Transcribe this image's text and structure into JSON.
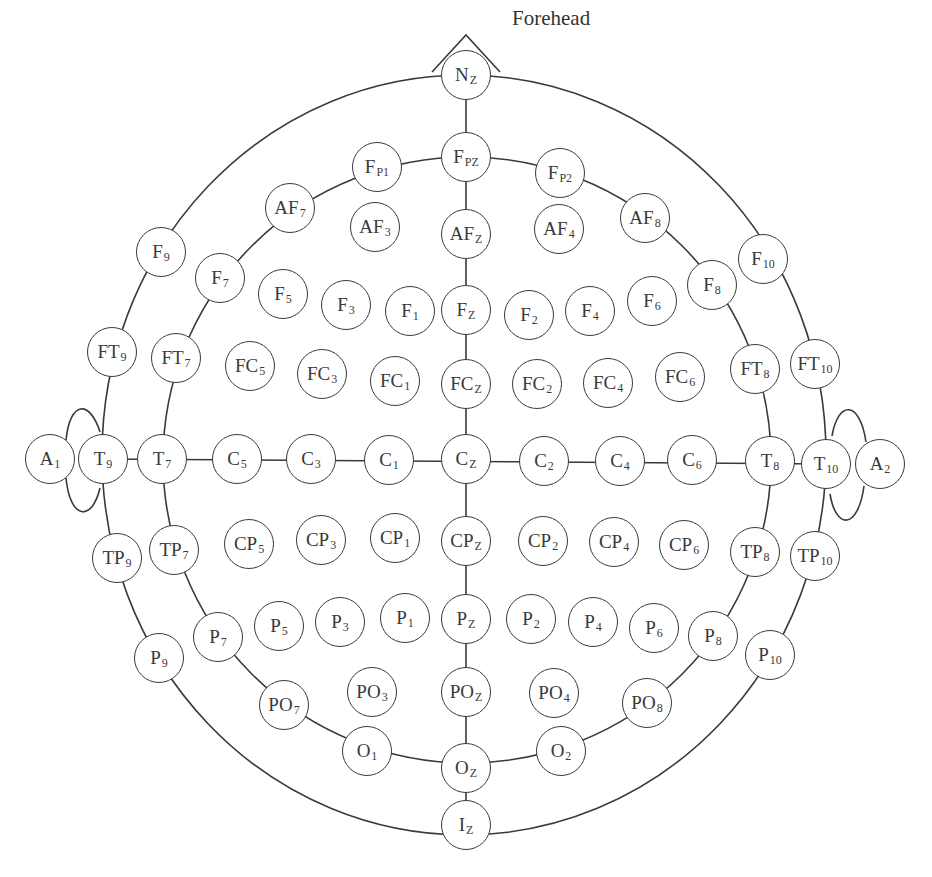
{
  "diagram": {
    "orientation_label": "Forehead",
    "line_color": "#3a3a3a",
    "background": "#ffffff"
  },
  "electrodes": [
    {
      "id": "Nz",
      "base": "N",
      "sub": "Z",
      "x": 466,
      "y": 75
    },
    {
      "id": "Fpz",
      "base": "F",
      "sub": "PZ",
      "x": 466,
      "y": 157
    },
    {
      "id": "Fp1",
      "base": "F",
      "sub": "P1",
      "x": 377,
      "y": 167
    },
    {
      "id": "Fp2",
      "base": "F",
      "sub": "P2",
      "x": 560,
      "y": 173
    },
    {
      "id": "AF7",
      "base": "AF",
      "sub": "7",
      "x": 290,
      "y": 208
    },
    {
      "id": "AF3",
      "base": "AF",
      "sub": "3",
      "x": 375,
      "y": 227
    },
    {
      "id": "AFz",
      "base": "AF",
      "sub": "Z",
      "x": 466,
      "y": 234
    },
    {
      "id": "AF4",
      "base": "AF",
      "sub": "4",
      "x": 559,
      "y": 229
    },
    {
      "id": "AF8",
      "base": "AF",
      "sub": "8",
      "x": 645,
      "y": 218
    },
    {
      "id": "F9",
      "base": "F",
      "sub": "9",
      "x": 161,
      "y": 252
    },
    {
      "id": "F7",
      "base": "F",
      "sub": "7",
      "x": 220,
      "y": 278
    },
    {
      "id": "F5",
      "base": "F",
      "sub": "5",
      "x": 283,
      "y": 294
    },
    {
      "id": "F3",
      "base": "F",
      "sub": "3",
      "x": 346,
      "y": 305
    },
    {
      "id": "F1",
      "base": "F",
      "sub": "1",
      "x": 410,
      "y": 311
    },
    {
      "id": "Fz",
      "base": "F",
      "sub": "Z",
      "x": 466,
      "y": 310
    },
    {
      "id": "F2",
      "base": "F",
      "sub": "2",
      "x": 529,
      "y": 315
    },
    {
      "id": "F4",
      "base": "F",
      "sub": "4",
      "x": 590,
      "y": 311
    },
    {
      "id": "F6",
      "base": "F",
      "sub": "6",
      "x": 652,
      "y": 301
    },
    {
      "id": "F8",
      "base": "F",
      "sub": "8",
      "x": 712,
      "y": 285
    },
    {
      "id": "F10",
      "base": "F",
      "sub": "10",
      "x": 763,
      "y": 259
    },
    {
      "id": "FT9",
      "base": "FT",
      "sub": "9",
      "x": 112,
      "y": 352
    },
    {
      "id": "FT7",
      "base": "FT",
      "sub": "7",
      "x": 176,
      "y": 358
    },
    {
      "id": "FC5",
      "base": "FC",
      "sub": "5",
      "x": 250,
      "y": 366
    },
    {
      "id": "FC3",
      "base": "FC",
      "sub": "3",
      "x": 322,
      "y": 374
    },
    {
      "id": "FC1",
      "base": "FC",
      "sub": "1",
      "x": 395,
      "y": 381
    },
    {
      "id": "FCz",
      "base": "FC",
      "sub": "Z",
      "x": 466,
      "y": 384
    },
    {
      "id": "FC2",
      "base": "FC",
      "sub": "2",
      "x": 537,
      "y": 384
    },
    {
      "id": "FC4",
      "base": "FC",
      "sub": "4",
      "x": 608,
      "y": 383
    },
    {
      "id": "FC6",
      "base": "FC",
      "sub": "6",
      "x": 680,
      "y": 377
    },
    {
      "id": "FT8",
      "base": "FT",
      "sub": "8",
      "x": 755,
      "y": 369
    },
    {
      "id": "FT10",
      "base": "FT",
      "sub": "10",
      "x": 815,
      "y": 364
    },
    {
      "id": "A1",
      "base": "A",
      "sub": "1",
      "x": 50,
      "y": 459
    },
    {
      "id": "T9",
      "base": "T",
      "sub": "9",
      "x": 103,
      "y": 459
    },
    {
      "id": "T7",
      "base": "T",
      "sub": "7",
      "x": 162,
      "y": 459
    },
    {
      "id": "C5",
      "base": "C",
      "sub": "5",
      "x": 237,
      "y": 459
    },
    {
      "id": "C3",
      "base": "C",
      "sub": "3",
      "x": 311,
      "y": 459
    },
    {
      "id": "C1",
      "base": "C",
      "sub": "1",
      "x": 389,
      "y": 460
    },
    {
      "id": "Cz",
      "base": "C",
      "sub": "Z",
      "x": 466,
      "y": 459
    },
    {
      "id": "C2",
      "base": "C",
      "sub": "2",
      "x": 544,
      "y": 461
    },
    {
      "id": "C4",
      "base": "C",
      "sub": "4",
      "x": 620,
      "y": 461
    },
    {
      "id": "C6",
      "base": "C",
      "sub": "6",
      "x": 692,
      "y": 460
    },
    {
      "id": "T8",
      "base": "T",
      "sub": "8",
      "x": 770,
      "y": 461
    },
    {
      "id": "T10",
      "base": "T",
      "sub": "10",
      "x": 826,
      "y": 464
    },
    {
      "id": "A2",
      "base": "A",
      "sub": "2",
      "x": 880,
      "y": 464
    },
    {
      "id": "TP9",
      "base": "TP",
      "sub": "9",
      "x": 117,
      "y": 558
    },
    {
      "id": "TP7",
      "base": "TP",
      "sub": "7",
      "x": 174,
      "y": 550
    },
    {
      "id": "CP5",
      "base": "CP",
      "sub": "5",
      "x": 249,
      "y": 544
    },
    {
      "id": "CP3",
      "base": "CP",
      "sub": "3",
      "x": 321,
      "y": 540
    },
    {
      "id": "CP1",
      "base": "CP",
      "sub": "1",
      "x": 395,
      "y": 538
    },
    {
      "id": "CPz",
      "base": "CP",
      "sub": "Z",
      "x": 466,
      "y": 541
    },
    {
      "id": "CP2",
      "base": "CP",
      "sub": "2",
      "x": 543,
      "y": 541
    },
    {
      "id": "CP4",
      "base": "CP",
      "sub": "4",
      "x": 614,
      "y": 542
    },
    {
      "id": "CP6",
      "base": "CP",
      "sub": "6",
      "x": 684,
      "y": 545
    },
    {
      "id": "TP8",
      "base": "TP",
      "sub": "8",
      "x": 755,
      "y": 552
    },
    {
      "id": "TP10",
      "base": "TP",
      "sub": "10",
      "x": 815,
      "y": 556
    },
    {
      "id": "P9",
      "base": "P",
      "sub": "9",
      "x": 159,
      "y": 658
    },
    {
      "id": "P7",
      "base": "P",
      "sub": "7",
      "x": 218,
      "y": 637
    },
    {
      "id": "P5",
      "base": "P",
      "sub": "5",
      "x": 279,
      "y": 626
    },
    {
      "id": "P3",
      "base": "P",
      "sub": "3",
      "x": 340,
      "y": 622
    },
    {
      "id": "P1",
      "base": "P",
      "sub": "1",
      "x": 405,
      "y": 618
    },
    {
      "id": "Pz",
      "base": "P",
      "sub": "Z",
      "x": 466,
      "y": 619
    },
    {
      "id": "P2",
      "base": "P",
      "sub": "2",
      "x": 531,
      "y": 619
    },
    {
      "id": "P4",
      "base": "P",
      "sub": "4",
      "x": 593,
      "y": 622
    },
    {
      "id": "P6",
      "base": "P",
      "sub": "6",
      "x": 654,
      "y": 628
    },
    {
      "id": "P8",
      "base": "P",
      "sub": "8",
      "x": 713,
      "y": 636
    },
    {
      "id": "P10",
      "base": "P",
      "sub": "10",
      "x": 770,
      "y": 655
    },
    {
      "id": "PO7",
      "base": "PO",
      "sub": "7",
      "x": 284,
      "y": 705
    },
    {
      "id": "PO3",
      "base": "PO",
      "sub": "3",
      "x": 372,
      "y": 692
    },
    {
      "id": "POz",
      "base": "PO",
      "sub": "Z",
      "x": 466,
      "y": 692
    },
    {
      "id": "PO4",
      "base": "PO",
      "sub": "4",
      "x": 554,
      "y": 693
    },
    {
      "id": "PO8",
      "base": "PO",
      "sub": "8",
      "x": 647,
      "y": 703
    },
    {
      "id": "O1",
      "base": "O",
      "sub": "1",
      "x": 367,
      "y": 751
    },
    {
      "id": "Oz",
      "base": "O",
      "sub": "Z",
      "x": 466,
      "y": 768
    },
    {
      "id": "O2",
      "base": "O",
      "sub": "2",
      "x": 561,
      "y": 751
    },
    {
      "id": "Iz",
      "base": "I",
      "sub": "Z",
      "x": 466,
      "y": 825
    }
  ]
}
